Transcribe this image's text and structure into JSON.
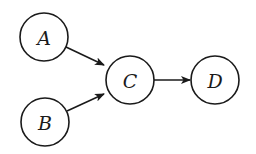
{
  "diagram": {
    "type": "directed-graph",
    "colors": {
      "stroke": "#1a1a1a",
      "background": "#ffffff",
      "node_fill": "#ffffff"
    },
    "nodes": [
      {
        "id": "A",
        "label": "A",
        "cx": 44,
        "cy": 37,
        "r": 24
      },
      {
        "id": "B",
        "label": "B",
        "cx": 45,
        "cy": 122,
        "r": 24
      },
      {
        "id": "C",
        "label": "C",
        "cx": 130,
        "cy": 80,
        "r": 24
      },
      {
        "id": "D",
        "label": "D",
        "cx": 215,
        "cy": 80,
        "r": 24
      }
    ],
    "edges": [
      {
        "from": "A",
        "to": "C",
        "x1": 66,
        "y1": 47,
        "x2": 104,
        "y2": 65
      },
      {
        "from": "B",
        "to": "C",
        "x1": 67,
        "y1": 111,
        "x2": 104,
        "y2": 94
      },
      {
        "from": "C",
        "to": "D",
        "x1": 154,
        "y1": 80,
        "x2": 190,
        "y2": 80
      }
    ]
  }
}
